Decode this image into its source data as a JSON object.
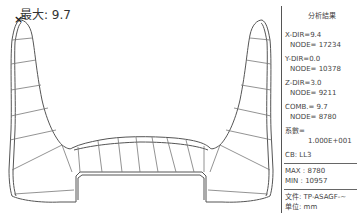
{
  "viewport": {
    "max_label": "最大: 9.7",
    "max_marker": "×",
    "colors": {
      "outline": "#555555",
      "mesh": "#777777",
      "background": "#ffffff"
    }
  },
  "panel": {
    "title": "分析結果",
    "x_dir": "X-DIR=9.4",
    "x_node": "NODE= 17234",
    "y_dir": "Y-DIR=0.0",
    "y_node": "NODE= 10378",
    "z_dir": "Z-DIR=3.0",
    "z_node": "NODE= 9211",
    "comb": "COMB.= 9.7",
    "comb_node": "NODE= 8780",
    "scale_label": "系數=",
    "scale_value": "1.000E+001",
    "cb": "CB: LL3",
    "max": "MAX : 8780",
    "min": "MIN : 10957",
    "file": "文件: TP-ASAGF-~",
    "unit": "单位: mm"
  }
}
